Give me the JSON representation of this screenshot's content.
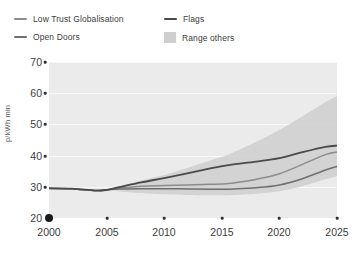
{
  "chart_data": {
    "type": "line",
    "title": "",
    "subtitle": "",
    "xlabel": "",
    "ylabel": "p/kWh min",
    "xlim": [
      2000,
      2025
    ],
    "ylim": [
      20,
      70
    ],
    "x_ticks": [
      "2000",
      "2005",
      "2010",
      "2015",
      "2020",
      "2025"
    ],
    "x_tick_values": [
      2000,
      2005,
      2010,
      2015,
      2020,
      2025
    ],
    "y_ticks": [
      "20",
      "30",
      "40",
      "50",
      "60",
      "70"
    ],
    "y_tick_values": [
      20,
      30,
      40,
      50,
      60,
      70
    ],
    "grid": "horizontal",
    "legend_position": "top-left-above-plot",
    "x": [
      2000,
      2002,
      2004,
      2005,
      2006,
      2008,
      2010,
      2012,
      2014,
      2015,
      2016,
      2018,
      2020,
      2022,
      2024,
      2025
    ],
    "series": [
      {
        "name": "Low Trust Globalisation",
        "color": "#8c8c8c",
        "values": [
          29.5,
          29.4,
          28.8,
          29.0,
          29.5,
          30.2,
          30.4,
          30.6,
          30.8,
          30.9,
          31.2,
          32.4,
          34.2,
          37.2,
          40.3,
          41.2
        ]
      },
      {
        "name": "Flags",
        "color": "#4a4a4a",
        "values": [
          29.5,
          29.4,
          28.8,
          29.0,
          29.8,
          31.4,
          32.8,
          34.3,
          35.9,
          36.6,
          37.2,
          38.1,
          39.2,
          41.1,
          42.8,
          43.2
        ]
      },
      {
        "name": "Open Doors",
        "color": "#6f6f6f",
        "values": [
          29.5,
          29.4,
          28.8,
          29.0,
          29.3,
          29.4,
          29.4,
          29.3,
          29.2,
          29.2,
          29.3,
          29.7,
          30.6,
          32.6,
          35.4,
          36.5
        ]
      }
    ],
    "band": {
      "name": "Range others",
      "color": "#cfcfcf",
      "upper": [
        29.5,
        29.4,
        28.8,
        29.0,
        30.0,
        32.0,
        33.8,
        36.0,
        38.4,
        39.6,
        41.0,
        44.4,
        48.2,
        52.6,
        57.2,
        59.0
      ],
      "lower": [
        29.5,
        29.4,
        28.8,
        29.0,
        28.6,
        28.0,
        27.6,
        27.4,
        27.3,
        27.3,
        27.4,
        27.8,
        28.6,
        30.2,
        32.4,
        33.4
      ]
    }
  },
  "legend": {
    "items": [
      {
        "label": "Low Trust Globalisation",
        "marker": "line",
        "color": "#8c8c8c",
        "icon": "legend-line-icon"
      },
      {
        "label": "Open Doors",
        "marker": "line",
        "color": "#6f6f6f",
        "icon": "legend-line-icon"
      },
      {
        "label": "Flags",
        "marker": "line",
        "color": "#4a4a4a",
        "icon": "legend-line-icon"
      },
      {
        "label": "Range others",
        "marker": "box",
        "color": "#cfcfcf",
        "icon": "legend-swatch-icon"
      }
    ]
  },
  "axes": {
    "y_title": "p/kWh min",
    "y_labels": [
      "70",
      "60",
      "50",
      "40",
      "30",
      "20"
    ],
    "x_labels": [
      "2000",
      "2005",
      "2010",
      "2015",
      "2020",
      "2025"
    ]
  },
  "colors": {
    "plot_background": "#ebebeb",
    "gridline": "#f7f7f7",
    "band": "#cfcfcf",
    "text": "#3d3d3d",
    "axis_dot": "#2f2f2f",
    "origin_dot": "#1a1a1a"
  }
}
